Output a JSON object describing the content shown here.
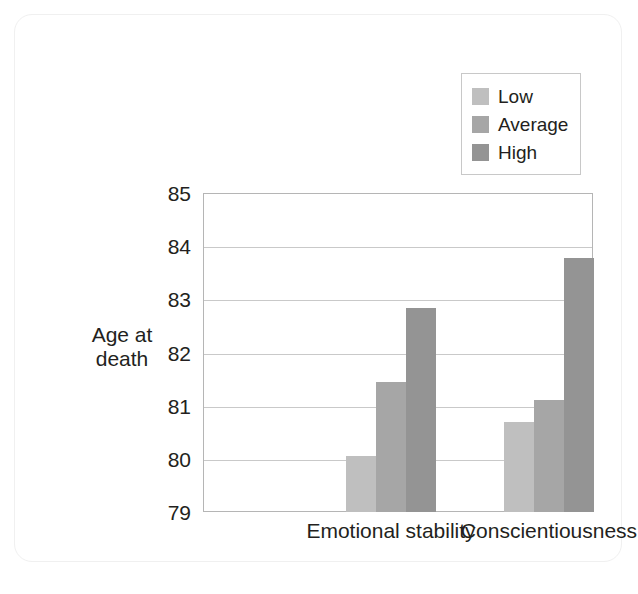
{
  "chart_data": {
    "type": "bar",
    "title": "",
    "subtitle": "",
    "xlabel": "",
    "ylabel": "Age at\ndeath",
    "ylabel_line1": "Age at",
    "ylabel_line2": "death",
    "categories": [
      "Emotional stability",
      "Conscientiousness"
    ],
    "series": [
      {
        "name": "Low",
        "values": [
          80.05,
          80.7
        ],
        "color": "#bfbfbf"
      },
      {
        "name": "Average",
        "values": [
          81.45,
          81.1
        ],
        "color": "#a6a6a6"
      },
      {
        "name": "High",
        "values": [
          82.83,
          83.78
        ],
        "color": "#949494"
      }
    ],
    "ylim": [
      79,
      85
    ],
    "yticks": [
      85,
      84,
      83,
      82,
      81,
      80,
      79
    ],
    "ytick_labels": [
      "85",
      "84",
      "83",
      "82",
      "81",
      "80",
      "79"
    ],
    "grid": true,
    "grid_axis": "y",
    "legend_position": "top-right",
    "legend_entries": [
      "Low",
      "Average",
      "High"
    ]
  },
  "style": {
    "background": "#ffffff",
    "axis_color": "#b5b5b5",
    "grid_color": "#c9c9c9",
    "text_color": "#231f20",
    "card_border": "#f0f0f0"
  }
}
